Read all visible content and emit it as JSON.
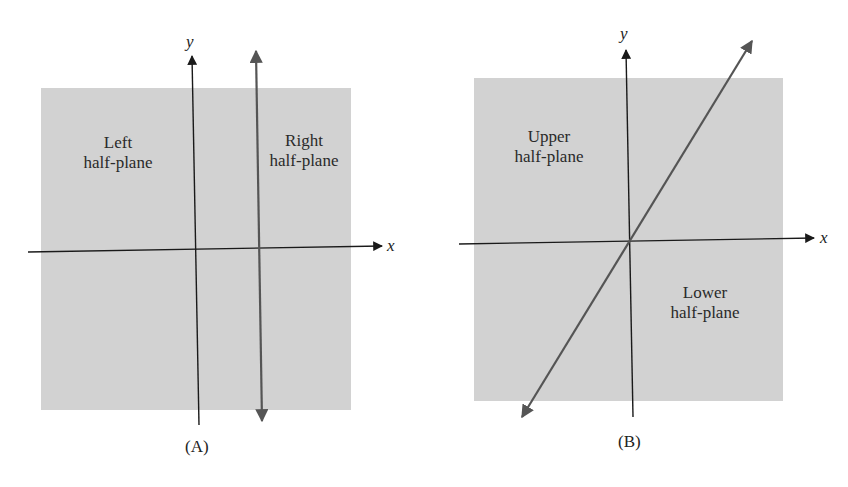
{
  "colors": {
    "region": "#d2d2d2",
    "axis": "#1a1a1a",
    "boundary": "#555555"
  },
  "panel_a": {
    "caption": "(A)",
    "axis_x_label": "x",
    "axis_y_label": "y",
    "left_region": {
      "line1": "Left",
      "line2": "half-plane"
    },
    "right_region": {
      "line1": "Right",
      "line2": "half-plane"
    }
  },
  "panel_b": {
    "caption": "(B)",
    "axis_x_label": "x",
    "axis_y_label": "y",
    "upper_region": {
      "line1": "Upper",
      "line2": "half-plane"
    },
    "lower_region": {
      "line1": "Lower",
      "line2": "half-plane"
    }
  }
}
